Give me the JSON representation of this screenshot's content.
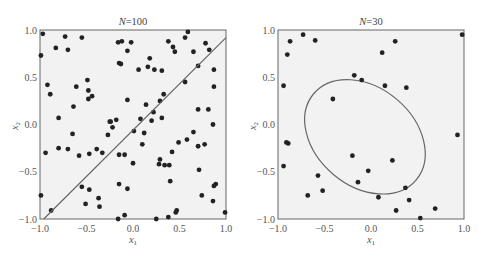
{
  "chart_data": [
    {
      "type": "scatter",
      "title_italic": "N",
      "title_rest": "=100",
      "xlabel": "x",
      "xlabel_sub": "1",
      "ylabel": "x",
      "ylabel_sub": "2",
      "xlim": [
        -1.0,
        1.0
      ],
      "ylim": [
        -1.0,
        1.0
      ],
      "xticks": [
        "−1.0",
        "−0.5",
        "0.0",
        "0.5",
        "1.0"
      ],
      "yticks": [
        "1.0",
        "0.5",
        "0.0",
        "−0.5",
        "−1.0"
      ],
      "grid": false,
      "line": {
        "x": [
          -0.96,
          1.0
        ],
        "y": [
          -1.0,
          0.92
        ],
        "label": "decision boundary"
      },
      "points": [
        [
          -0.97,
          0.96
        ],
        [
          -0.73,
          0.93
        ],
        [
          -0.55,
          0.92
        ],
        [
          -0.83,
          0.81
        ],
        [
          -0.7,
          0.79
        ],
        [
          -0.99,
          0.73
        ],
        [
          -0.16,
          0.87
        ],
        [
          -0.12,
          0.88
        ],
        [
          -0.02,
          0.87
        ],
        [
          -0.06,
          0.78
        ],
        [
          -0.15,
          0.65
        ],
        [
          -0.13,
          0.64
        ],
        [
          -0.49,
          0.47
        ],
        [
          -0.92,
          0.42
        ],
        [
          -0.61,
          0.4
        ],
        [
          -0.48,
          0.36
        ],
        [
          -0.89,
          0.32
        ],
        [
          -0.44,
          0.3
        ],
        [
          -0.48,
          0.27
        ],
        [
          -0.06,
          0.26
        ],
        [
          -0.64,
          0.19
        ],
        [
          -0.8,
          0.07
        ],
        [
          -0.25,
          0.03
        ],
        [
          -0.24,
          0.03
        ],
        [
          -0.18,
          0.05
        ],
        [
          0.59,
          0.98
        ],
        [
          0.56,
          0.92
        ],
        [
          0.38,
          0.88
        ],
        [
          0.43,
          0.82
        ],
        [
          0.45,
          0.77
        ],
        [
          0.78,
          0.86
        ],
        [
          0.82,
          0.79
        ],
        [
          0.65,
          0.77
        ],
        [
          0.18,
          0.7
        ],
        [
          0.16,
          0.61
        ],
        [
          0.23,
          0.58
        ],
        [
          0.31,
          0.57
        ],
        [
          0.06,
          0.58
        ],
        [
          0.7,
          0.62
        ],
        [
          0.87,
          0.58
        ],
        [
          0.56,
          0.45
        ],
        [
          0.87,
          0.4
        ],
        [
          0.33,
          0.32
        ],
        [
          0.29,
          0.25
        ],
        [
          0.14,
          0.21
        ],
        [
          0.7,
          0.16
        ],
        [
          0.81,
          0.16
        ],
        [
          0.22,
          0.13
        ],
        [
          0.08,
          0.06
        ],
        [
          0.2,
          0.04
        ],
        [
          0.31,
          0.07
        ],
        [
          0.86,
          0.0
        ],
        [
          -0.65,
          -0.1
        ],
        [
          -0.27,
          -0.11
        ],
        [
          -0.22,
          -0.03
        ],
        [
          -0.94,
          -0.3
        ],
        [
          -0.8,
          -0.25
        ],
        [
          -0.7,
          -0.26
        ],
        [
          -0.58,
          -0.33
        ],
        [
          -0.47,
          -0.31
        ],
        [
          -0.39,
          -0.26
        ],
        [
          -0.33,
          -0.3
        ],
        [
          -0.15,
          -0.32
        ],
        [
          -0.09,
          -0.32
        ],
        [
          0.0,
          -0.41
        ],
        [
          -0.55,
          -0.66
        ],
        [
          -0.47,
          -0.69
        ],
        [
          -0.15,
          -0.63
        ],
        [
          -0.06,
          -0.68
        ],
        [
          -0.99,
          -0.75
        ],
        [
          -0.37,
          -0.78
        ],
        [
          -0.51,
          -0.84
        ],
        [
          -0.36,
          -0.87
        ],
        [
          -0.88,
          -0.91
        ],
        [
          -0.09,
          -0.96
        ],
        [
          -0.16,
          -1.0
        ],
        [
          0.01,
          -0.07
        ],
        [
          0.12,
          -0.09
        ],
        [
          0.1,
          -0.21
        ],
        [
          0.65,
          -0.08
        ],
        [
          0.49,
          -0.19
        ],
        [
          0.58,
          -0.16
        ],
        [
          0.7,
          -0.23
        ],
        [
          0.77,
          -0.21
        ],
        [
          0.42,
          -0.29
        ],
        [
          0.29,
          -0.37
        ],
        [
          0.28,
          -0.42
        ],
        [
          0.34,
          -0.43
        ],
        [
          0.39,
          -0.43
        ],
        [
          0.71,
          -0.48
        ],
        [
          0.4,
          -0.6
        ],
        [
          0.89,
          -0.63
        ],
        [
          0.87,
          -0.65
        ],
        [
          0.74,
          -0.75
        ],
        [
          0.86,
          -0.81
        ],
        [
          0.47,
          -0.91
        ],
        [
          0.46,
          -0.93
        ],
        [
          0.99,
          -0.93
        ],
        [
          0.38,
          -0.98
        ],
        [
          0.25,
          -1.0
        ]
      ]
    },
    {
      "type": "scatter",
      "title_italic": "N",
      "title_rest": "=30",
      "xlabel": "x",
      "xlabel_sub": "1",
      "ylabel": "x",
      "ylabel_sub": "2",
      "xlim": [
        -1.0,
        1.0
      ],
      "ylim": [
        -1.0,
        1.0
      ],
      "xticks": [
        "−1.0",
        "−0.5",
        "0.0",
        "0.5",
        "1.0"
      ],
      "yticks": [
        "1.0",
        "0.5",
        "0.0",
        "−0.5",
        "−1.0"
      ],
      "grid": false,
      "ellipse": {
        "cx": -0.065,
        "cy": -0.13,
        "rx": 0.72,
        "ry": 0.52,
        "rotation_deg": 40,
        "label": "decision boundary"
      },
      "points": [
        [
          -0.73,
          0.95
        ],
        [
          -0.87,
          0.88
        ],
        [
          -0.6,
          0.89
        ],
        [
          -0.9,
          0.74
        ],
        [
          -0.94,
          0.41
        ],
        [
          -0.18,
          0.52
        ],
        [
          -0.1,
          0.47
        ],
        [
          -0.41,
          0.27
        ],
        [
          0.98,
          0.95
        ],
        [
          0.26,
          0.88
        ],
        [
          0.12,
          0.76
        ],
        [
          0.15,
          0.41
        ],
        [
          0.38,
          0.39
        ],
        [
          -0.91,
          -0.19
        ],
        [
          -0.89,
          -0.2
        ],
        [
          -0.94,
          -0.44
        ],
        [
          -0.2,
          -0.33
        ],
        [
          -0.03,
          -0.49
        ],
        [
          -0.57,
          -0.54
        ],
        [
          -0.14,
          -0.61
        ],
        [
          -0.52,
          -0.7
        ],
        [
          -0.68,
          -0.75
        ],
        [
          0.93,
          -0.11
        ],
        [
          0.23,
          -0.38
        ],
        [
          0.37,
          -0.67
        ],
        [
          0.08,
          -0.77
        ],
        [
          0.41,
          -0.8
        ],
        [
          0.27,
          -0.91
        ],
        [
          0.69,
          -0.89
        ],
        [
          0.53,
          -0.99
        ]
      ]
    }
  ]
}
